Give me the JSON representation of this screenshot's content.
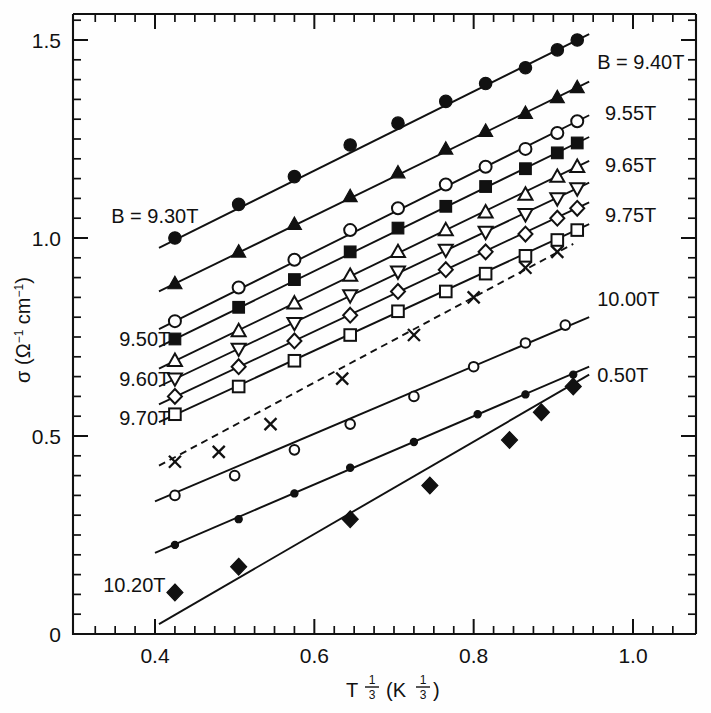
{
  "figure": {
    "title": "",
    "y_axis_label_sigma": "σ",
    "y_axis_label_units": "(Ω",
    "y_axis_label_units_exp1": "−1",
    "y_axis_label_units_mid": " cm",
    "y_axis_label_units_exp2": "−1",
    "y_axis_label_units_close": ")",
    "x_axis_label_base": "T",
    "x_axis_label_exp_num": "1",
    "x_axis_label_exp_den": "3",
    "x_axis_label_paren_open": "(K",
    "x_axis_label_paren_close": ")"
  },
  "axes": {
    "x_tick_labels": [
      "0.4",
      "0.6",
      "0.8",
      "1.0"
    ],
    "x_tick_values": [
      0.4,
      0.6,
      0.8,
      1.0
    ],
    "y_tick_labels": [
      "0",
      "0.5",
      "1.0",
      "1.5"
    ],
    "y_tick_values": [
      0,
      0.5,
      1.0,
      1.5
    ],
    "x_minor_step": 0.025,
    "y_minor_step": 0.05,
    "xlim": [
      0.3,
      1.08
    ],
    "ylim": [
      0,
      1.6
    ]
  },
  "labels_left": [
    {
      "text": "B = 9.30T",
      "x": 0.345,
      "y": 1.055
    },
    {
      "text": "9.50T",
      "x": 0.355,
      "y": 0.745
    },
    {
      "text": "9.60T",
      "x": 0.355,
      "y": 0.645
    },
    {
      "text": "9.70T",
      "x": 0.355,
      "y": 0.545
    },
    {
      "text": "10.20T",
      "x": 0.335,
      "y": 0.125
    }
  ],
  "labels_right": [
    {
      "text": "B = 9.40T",
      "x": 0.955,
      "y": 1.445
    },
    {
      "text": "9.55T",
      "x": 0.965,
      "y": 1.315
    },
    {
      "text": "9.65T",
      "x": 0.965,
      "y": 1.185
    },
    {
      "text": "9.75T",
      "x": 0.965,
      "y": 1.058
    },
    {
      "text": "10.00T",
      "x": 0.955,
      "y": 0.845
    },
    {
      "text": "0.50T",
      "x": 0.955,
      "y": 0.655
    }
  ],
  "chart_data": {
    "type": "scatter",
    "title": "",
    "xlabel": "T^(1/3) (K^(1/3))",
    "ylabel": "σ (Ω⁻¹ cm⁻¹)",
    "xlim": [
      0.3,
      1.08
    ],
    "ylim": [
      0,
      1.6
    ],
    "grid": false,
    "legend": "inline-annotations",
    "series": [
      {
        "name": "B = 9.30T",
        "label_side": "left",
        "marker": "filled-circle",
        "line": "solid",
        "x": [
          0.425,
          0.505,
          0.575,
          0.645,
          0.705,
          0.765,
          0.815,
          0.865,
          0.905,
          0.93
        ],
        "y": [
          1.0,
          1.085,
          1.155,
          1.235,
          1.29,
          1.345,
          1.39,
          1.43,
          1.475,
          1.5
        ],
        "fit_x": [
          0.405,
          0.945
        ],
        "fit_y": [
          0.975,
          1.515
        ]
      },
      {
        "name": "B = 9.40T",
        "label_side": "right",
        "marker": "filled-triangle-up",
        "line": "solid",
        "x": [
          0.425,
          0.505,
          0.575,
          0.645,
          0.705,
          0.765,
          0.815,
          0.865,
          0.905,
          0.93
        ],
        "y": [
          0.885,
          0.965,
          1.035,
          1.105,
          1.165,
          1.225,
          1.27,
          1.315,
          1.355,
          1.38
        ],
        "fit_x": [
          0.405,
          0.945
        ],
        "fit_y": [
          0.865,
          1.395
        ]
      },
      {
        "name": "9.50T",
        "label_side": "left",
        "marker": "open-circle",
        "line": "solid",
        "x": [
          0.425,
          0.505,
          0.575,
          0.645,
          0.705,
          0.765,
          0.815,
          0.865,
          0.905,
          0.93
        ],
        "y": [
          0.79,
          0.875,
          0.945,
          1.02,
          1.075,
          1.135,
          1.18,
          1.225,
          1.265,
          1.295
        ],
        "fit_x": [
          0.405,
          0.945
        ],
        "fit_y": [
          0.77,
          1.31
        ]
      },
      {
        "name": "9.55T",
        "label_side": "right",
        "marker": "filled-square",
        "line": "solid",
        "x": [
          0.425,
          0.505,
          0.575,
          0.645,
          0.705,
          0.765,
          0.815,
          0.865,
          0.905,
          0.93
        ],
        "y": [
          0.745,
          0.825,
          0.895,
          0.965,
          1.025,
          1.08,
          1.13,
          1.175,
          1.215,
          1.24
        ],
        "fit_x": [
          0.405,
          0.945
        ],
        "fit_y": [
          0.725,
          1.255
        ]
      },
      {
        "name": "9.60T",
        "label_side": "left",
        "marker": "open-triangle-up",
        "line": "solid",
        "x": [
          0.425,
          0.505,
          0.575,
          0.645,
          0.705,
          0.765,
          0.815,
          0.865,
          0.905,
          0.93
        ],
        "y": [
          0.69,
          0.765,
          0.835,
          0.905,
          0.965,
          1.02,
          1.065,
          1.11,
          1.155,
          1.18
        ],
        "fit_x": [
          0.405,
          0.945
        ],
        "fit_y": [
          0.67,
          1.195
        ]
      },
      {
        "name": "9.65T",
        "label_side": "right",
        "marker": "open-triangle-down",
        "line": "solid",
        "x": [
          0.425,
          0.505,
          0.575,
          0.645,
          0.705,
          0.765,
          0.815,
          0.865,
          0.905,
          0.93
        ],
        "y": [
          0.645,
          0.72,
          0.785,
          0.855,
          0.915,
          0.97,
          1.015,
          1.06,
          1.1,
          1.125
        ],
        "fit_x": [
          0.405,
          0.945
        ],
        "fit_y": [
          0.625,
          1.14
        ]
      },
      {
        "name": "9.70T",
        "label_side": "left",
        "marker": "open-diamond",
        "line": "solid",
        "x": [
          0.425,
          0.505,
          0.575,
          0.645,
          0.705,
          0.765,
          0.815,
          0.865,
          0.905,
          0.93
        ],
        "y": [
          0.6,
          0.675,
          0.74,
          0.805,
          0.865,
          0.92,
          0.965,
          1.01,
          1.05,
          1.075
        ],
        "fit_x": [
          0.405,
          0.945
        ],
        "fit_y": [
          0.58,
          1.09
        ]
      },
      {
        "name": "9.75T",
        "label_side": "right",
        "marker": "open-square",
        "line": "solid",
        "x": [
          0.425,
          0.505,
          0.575,
          0.645,
          0.705,
          0.765,
          0.815,
          0.865,
          0.905,
          0.93
        ],
        "y": [
          0.555,
          0.625,
          0.69,
          0.755,
          0.815,
          0.865,
          0.91,
          0.955,
          0.995,
          1.02
        ],
        "fit_x": [
          0.405,
          0.945
        ],
        "fit_y": [
          0.535,
          1.035
        ]
      },
      {
        "name": "unlabeled-x-series",
        "label_side": "none",
        "marker": "x-cross",
        "line": "dashed",
        "x": [
          0.425,
          0.48,
          0.545,
          0.635,
          0.725,
          0.8,
          0.865,
          0.905
        ],
        "y": [
          0.435,
          0.46,
          0.53,
          0.645,
          0.755,
          0.85,
          0.925,
          0.965
        ],
        "fit_x": [
          0.405,
          0.925
        ],
        "fit_y": [
          0.425,
          0.985
        ]
      },
      {
        "name": "10.00T",
        "label_side": "right",
        "marker": "open-circle-small",
        "line": "solid",
        "x": [
          0.425,
          0.5,
          0.575,
          0.645,
          0.725,
          0.8,
          0.865,
          0.915
        ],
        "y": [
          0.35,
          0.4,
          0.465,
          0.53,
          0.6,
          0.675,
          0.735,
          0.78
        ],
        "fit_x": [
          0.4,
          0.945
        ],
        "fit_y": [
          0.335,
          0.8
        ]
      },
      {
        "name": "10.20T",
        "label_side": "left",
        "marker": "small-dot",
        "line": "solid",
        "x": [
          0.425,
          0.505,
          0.575,
          0.645,
          0.725,
          0.805,
          0.865,
          0.925
        ],
        "y": [
          0.225,
          0.29,
          0.355,
          0.42,
          0.485,
          0.555,
          0.605,
          0.655
        ],
        "fit_x": [
          0.4,
          0.945
        ],
        "fit_y": [
          0.205,
          0.675
        ]
      },
      {
        "name": "0.50T",
        "label_side": "right",
        "marker": "filled-diamond",
        "line": "solid",
        "x": [
          0.425,
          0.505,
          0.645,
          0.745,
          0.845,
          0.885,
          0.925
        ],
        "y": [
          0.105,
          0.17,
          0.29,
          0.375,
          0.49,
          0.56,
          0.625
        ],
        "fit_x": [
          0.405,
          0.945
        ],
        "fit_y": [
          0.025,
          0.655
        ]
      }
    ]
  }
}
